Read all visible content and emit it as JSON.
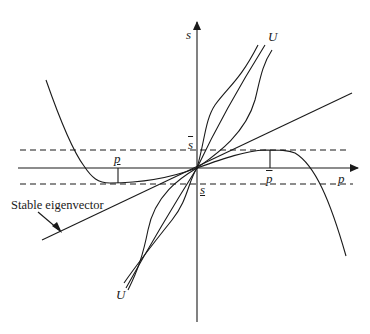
{
  "diagram": {
    "axes": {
      "x_label": "p",
      "y_label": "s"
    },
    "levels": {
      "s_upper": "s",
      "s_lower": "s",
      "p_lower": "p",
      "p_upper": "p"
    },
    "curve_labels": {
      "top_U": "U",
      "bottom_U": "U"
    },
    "annotation": "Stable eigenvector",
    "colors": {
      "line": "#1a1a1a",
      "background": "#ffffff"
    }
  }
}
